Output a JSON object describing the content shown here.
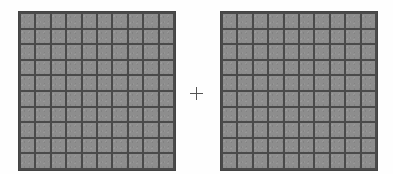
{
  "figure": {
    "background_color": "#fefefe",
    "width": 393,
    "height": 174
  },
  "operator": {
    "symbol": "+",
    "name": "plus-sign",
    "color": "#555555"
  },
  "grids": [
    {
      "id": "grid-left",
      "label": "Left grid",
      "rows": 10,
      "columns": 10,
      "cell_count": 100,
      "cell_color": "#8d8d8d",
      "line_color": "#4a4a4a"
    },
    {
      "id": "grid-right",
      "label": "Right grid",
      "rows": 10,
      "columns": 10,
      "cell_count": 100,
      "cell_color": "#8d8d8d",
      "line_color": "#4a4a4a"
    }
  ]
}
